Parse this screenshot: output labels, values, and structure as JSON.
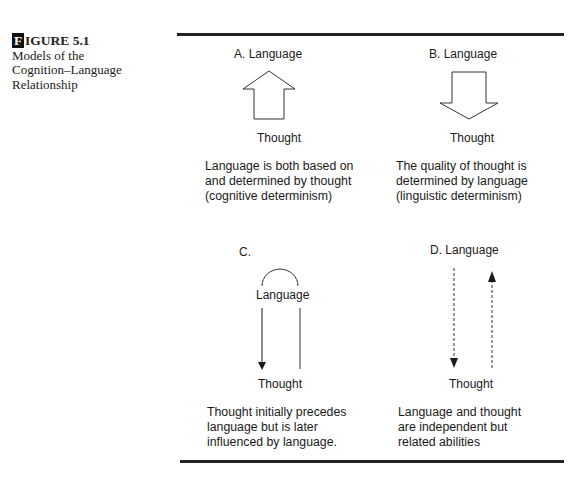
{
  "figure": {
    "number_initial": "F",
    "number_rest": "IGURE 5.1",
    "title_line1": "Models of the",
    "title_line2": "Cognition–Language",
    "title_line3": "Relationship"
  },
  "panels": [
    {
      "id": "A",
      "top_label": "A.  Language",
      "bottom_label": "Thought",
      "arrow": "hollow-up",
      "description": [
        "Language is both based on",
        "and determined by thought",
        "(cognitive determinism)"
      ]
    },
    {
      "id": "B",
      "top_label": "B.  Language",
      "bottom_label": "Thought",
      "arrow": "hollow-down",
      "description": [
        "The quality of thought is",
        "determined by language",
        "(linguistic determinism)"
      ]
    },
    {
      "id": "C",
      "letter": "C.",
      "top_label": "Language",
      "bottom_label": "Thought",
      "arrow": "arc-with-down-arrow",
      "description": [
        "Thought initially precedes",
        "language but is later",
        "influenced by language."
      ]
    },
    {
      "id": "D",
      "top_label": "D.  Language",
      "bottom_label": "Thought",
      "arrow": "dashed-bidirectional",
      "description": [
        "Language and thought",
        "are independent but",
        "related abilities"
      ]
    }
  ]
}
